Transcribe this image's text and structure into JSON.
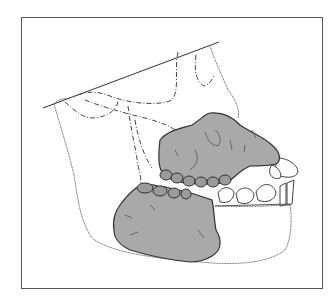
{
  "figure": {
    "colors": {
      "background": "#ffffff",
      "frame": "#555555",
      "outline": "#333333",
      "fossil_fill": "#a9a9a9",
      "fossil_texture": "#5a5a5a",
      "dashed": "#444444"
    }
  }
}
